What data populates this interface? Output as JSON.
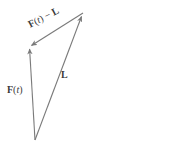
{
  "figure": {
    "kind": "vector-triangle-diagram",
    "background_color": "#ffffff",
    "stroke_color": "#7a7a7a",
    "text_color": "#3a3a3a",
    "width": 187,
    "height": 150
  },
  "labels": {
    "difference": {
      "full_text": "F(t) − L",
      "bold_head": "F",
      "paren_open": "(",
      "italic_var": "t",
      "paren_close": ")",
      "operator": " − ",
      "bold_tail": "L"
    },
    "force": {
      "full_text": "F(t)",
      "bold_head": "F",
      "paren_open": "(",
      "italic_var": "t",
      "paren_close": ")"
    },
    "limit": {
      "full_text": "L",
      "bold_head": "L"
    }
  },
  "geometry": {
    "origin": {
      "x": 35,
      "y": 140
    },
    "tip_force": {
      "x": 29,
      "y": 47
    },
    "tip_limit": {
      "x": 83,
      "y": 13
    },
    "vectors": [
      {
        "name": "force-vector",
        "from": {
          "x": 35,
          "y": 140
        },
        "to": {
          "x": 29,
          "y": 47
        },
        "arrow_at": "to"
      },
      {
        "name": "limit-vector",
        "from": {
          "x": 35,
          "y": 140
        },
        "to": {
          "x": 83,
          "y": 13
        },
        "arrow_at": "to"
      },
      {
        "name": "difference-vector",
        "from": {
          "x": 83,
          "y": 13
        },
        "to": {
          "x": 29,
          "y": 47
        },
        "arrow_at": "to"
      }
    ]
  }
}
